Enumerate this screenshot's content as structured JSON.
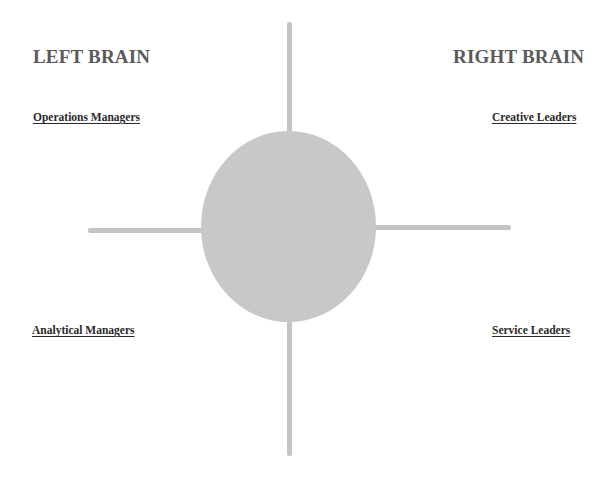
{
  "diagram": {
    "headings": {
      "left": "LEFT BRAIN",
      "right": "RIGHT BRAIN"
    },
    "quadrants": {
      "top_left": "Operations Managers",
      "top_right": "Creative Leaders",
      "bottom_left": "Analytical Managers",
      "bottom_right": "Service Leaders"
    },
    "colors": {
      "heading": "#5a5a5a",
      "label": "#2a2a2a",
      "axis_line": "#c4c4c4",
      "center_circle": "#c8c8c8"
    }
  }
}
